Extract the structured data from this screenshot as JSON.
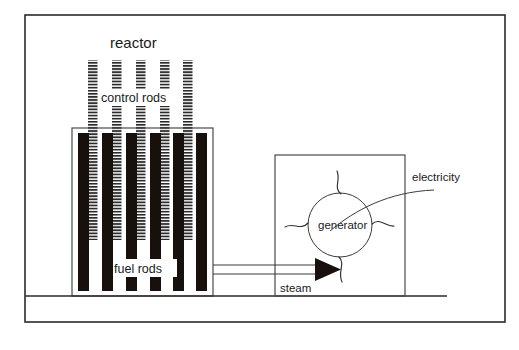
{
  "diagram": {
    "labels": {
      "reactor": "reactor",
      "control_rods": "control rods",
      "fuel_rods": "fuel rods",
      "generator": "generator",
      "steam": "steam",
      "electricity": "electricity"
    },
    "colors": {
      "fuel_rod_fill": "#17100d",
      "control_rod_stripe": "#2b2b2b",
      "outline": "#2b2b2b",
      "background": "#ffffff",
      "text": "#1a1a1a"
    },
    "components": {
      "outer_frame": {
        "x": 25,
        "y": 15,
        "width": 480,
        "height": 307
      },
      "ground_line": {
        "x1": 25,
        "y1": 296,
        "x2": 447,
        "y2": 296
      },
      "reactor_vessel": {
        "x": 72,
        "y": 128,
        "width": 141,
        "height": 168
      },
      "generator_housing": {
        "x": 275,
        "y": 155,
        "width": 130,
        "height": 141
      },
      "generator_circle": {
        "cx": 340,
        "cy": 225,
        "r": 32
      },
      "control_rod_count": 5,
      "fuel_rod_count": 6,
      "steam_pipe": {
        "x1": 213,
        "y1": 266,
        "x2": 318,
        "y2": 272
      }
    }
  }
}
